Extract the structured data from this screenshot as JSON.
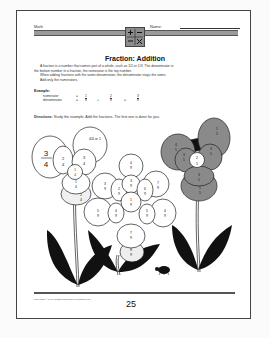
{
  "header": {
    "subject_label": "Math",
    "name_label": "Name:",
    "emblem_icon": "math-operations-emblem"
  },
  "title": "Fraction: Addition",
  "intro": {
    "line1": "A fraction is a number that names part of a whole, such as 1/2 or 1/3. The denominator is",
    "line2": "the bottom number in a fraction, the numerator is the top number.",
    "line3": "When adding fractions with the same denominator, the denominator stays the same.",
    "line4": "Add only the numerators."
  },
  "example": {
    "label": "Example:",
    "numerator_label": "numerator",
    "denominator_label": "denominator",
    "eq1": "=",
    "eq2": "=",
    "plus": "+",
    "equals": "=",
    "frac1_num": "1",
    "frac1_den": "8",
    "frac2_num": "2",
    "frac2_den": "8",
    "frac3_num": "3",
    "frac3_den": "8"
  },
  "directions": {
    "label": "Directions:",
    "text": "Study the example. Add the fractions. The first one is done for you."
  },
  "flowers": [
    {
      "name": "left-flower",
      "center": "1/4",
      "petals": [
        "3/4",
        "2/4",
        "3/4",
        "4/4 or 1",
        "1/4",
        "2/4"
      ]
    },
    {
      "name": "middle-flower",
      "center": "1/9",
      "petals": [
        "4/9",
        "3/9",
        "2/9",
        "3/9",
        "6/9",
        "7/9",
        "5/9",
        "4/9",
        "8/9",
        "5/9",
        "4/9",
        "7/9",
        "8/9"
      ]
    },
    {
      "name": "right-flower",
      "center": "2/5",
      "petals": [
        "4/5",
        "3/5",
        "1/5",
        "3/5",
        "3/5",
        "5/5"
      ]
    }
  ],
  "footer": {
    "copyright": "Copyright © 1991 Grafton Education Publishing Inc.",
    "page_number": "25"
  }
}
